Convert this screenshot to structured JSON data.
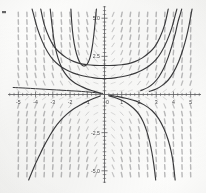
{
  "chart_data": {
    "type": "line",
    "title": "",
    "subtitle": "",
    "xlabel": "",
    "ylabel": "",
    "xlim": [
      -5.6,
      5.6
    ],
    "ylim": [
      -5.8,
      5.8
    ],
    "grid": false,
    "axis_style": "center-cross",
    "background_color": "#fdfdfc",
    "axis_color": "#58585a",
    "curve_color": "#3b3b3d",
    "field_color": "#8c8c8e",
    "x_ticks": [
      -5,
      -4,
      -3,
      -2,
      -1,
      0,
      1,
      2,
      3,
      4,
      5
    ],
    "x_tick_labels": [
      "-5",
      "-4",
      "-3",
      "-2",
      "-1",
      "0",
      "1",
      "2",
      "3",
      "4",
      "5"
    ],
    "x_minor_tick_step": 0.25,
    "y_ticks": [
      -5.0,
      -2.5,
      2.5,
      5.0
    ],
    "y_tick_labels": [
      "-5.0",
      "-2.5",
      "2.5",
      "5.0"
    ],
    "y_minor_tick_step": 0.25,
    "slope_field": {
      "description": "direction field of hand-drawn dash marks, steep near vertical toward left/right extremes, shallow near the horizontal axis",
      "x_start": -5.0,
      "x_end": 5.0,
      "x_step": 0.5,
      "y_start": -5.25,
      "y_end": 5.25,
      "y_step": 0.5,
      "marker_length": 4.5,
      "slope_formula": "dy/dx = y * x",
      "color": "#8e8e90",
      "opacity": 0.62
    },
    "series": [
      {
        "name": "solution-curve-1",
        "kind": "even-symmetric-well",
        "note": "shallow U through (0, 1.05) rising steeply past |x|=3.6",
        "param_c": 1.05,
        "color": "#3b3b3d",
        "width": 1.15,
        "points_x": [
          -4.2,
          -3.9,
          -3.6,
          -3.3,
          -3.0,
          -2.6,
          -2.2,
          -1.8,
          -1.4,
          -1.0,
          -0.6,
          -0.2,
          0.2,
          0.6,
          1.0,
          1.4,
          1.8,
          2.2,
          2.6,
          3.0,
          3.3,
          3.6,
          3.9,
          4.2
        ],
        "points_y": [
          5.6,
          4.35,
          3.45,
          2.78,
          2.3,
          1.88,
          1.6,
          1.4,
          1.26,
          1.16,
          1.09,
          1.05,
          1.05,
          1.09,
          1.16,
          1.26,
          1.4,
          1.6,
          1.88,
          2.3,
          2.78,
          3.45,
          4.35,
          5.6
        ]
      },
      {
        "name": "solution-curve-2",
        "kind": "even-symmetric-well",
        "note": "U through (0, 1.9), steeper walls near |x|=3.2",
        "param_c": 1.9,
        "color": "#3b3b3d",
        "width": 1.15,
        "points_x": [
          -3.7,
          -3.5,
          -3.2,
          -2.9,
          -2.6,
          -2.2,
          -1.8,
          -1.4,
          -1.0,
          -0.6,
          -0.2,
          0.2,
          0.6,
          1.0,
          1.4,
          1.8,
          2.2,
          2.6,
          2.9,
          3.2,
          3.5,
          3.7
        ],
        "points_y": [
          5.6,
          4.6,
          3.7,
          3.1,
          2.75,
          2.4,
          2.17,
          2.02,
          1.95,
          1.91,
          1.9,
          1.9,
          1.91,
          1.95,
          2.02,
          2.17,
          2.4,
          2.75,
          3.1,
          3.7,
          4.6,
          5.6
        ]
      },
      {
        "name": "solution-curve-3",
        "kind": "narrow-well-left",
        "note": "narrow U centred near x=-1.15 with near vertical arms",
        "param_c": 0.0,
        "color": "#3b3b3d",
        "width": 1.15,
        "points_x": [
          -1.95,
          -1.9,
          -1.82,
          -1.7,
          -1.55,
          -1.4,
          -1.25,
          -1.1,
          -0.95,
          -0.82,
          -0.7,
          -0.6,
          -0.52,
          -0.47
        ],
        "points_y": [
          5.6,
          4.7,
          3.8,
          3.0,
          2.4,
          2.05,
          1.88,
          1.9,
          2.1,
          2.5,
          3.2,
          4.1,
          5.0,
          5.6
        ]
      },
      {
        "name": "solution-curve-4",
        "kind": "hyperbolic-branch-left",
        "note": "upper-left branch falling from y=5.6 near x=-3.1 and flattening toward the x-axis",
        "color": "#3b3b3d",
        "width": 1.15,
        "points_x": [
          -3.15,
          -3.05,
          -2.95,
          -2.85,
          -2.7,
          -2.5,
          -2.3,
          -2.0,
          -1.7,
          -1.4,
          -1.1,
          -0.8,
          -0.5,
          -0.2
        ],
        "points_y": [
          5.6,
          4.6,
          3.7,
          3.05,
          2.4,
          1.8,
          1.4,
          1.0,
          0.74,
          0.55,
          0.4,
          0.28,
          0.17,
          0.07
        ]
      },
      {
        "name": "solution-curve-5",
        "kind": "hyperbolic-branch-left-lower",
        "note": "lower-left branch dropping to y=-5.6 near x=-4.35",
        "color": "#3b3b3d",
        "width": 1.15,
        "points_x": [
          -0.25,
          -0.6,
          -1.0,
          -1.4,
          -1.8,
          -2.2,
          -2.55,
          -2.9,
          -3.2,
          -3.5,
          -3.8,
          -4.05,
          -4.25,
          -4.4
        ],
        "points_y": [
          -0.1,
          -0.25,
          -0.45,
          -0.68,
          -0.95,
          -1.3,
          -1.7,
          -2.2,
          -2.75,
          -3.35,
          -4.05,
          -4.65,
          -5.2,
          -5.6
        ]
      },
      {
        "name": "solution-curve-6",
        "kind": "hyperbolic-branch-right",
        "note": "right-side branch from near the origin diving to -5.6 around x=2.95",
        "color": "#3b3b3d",
        "width": 1.15,
        "points_x": [
          0.25,
          0.6,
          1.0,
          1.35,
          1.7,
          2.0,
          2.25,
          2.45,
          2.62,
          2.75,
          2.85,
          2.92,
          2.97
        ],
        "points_y": [
          -0.08,
          -0.2,
          -0.38,
          -0.6,
          -0.92,
          -1.3,
          -1.8,
          -2.4,
          -3.1,
          -3.8,
          -4.5,
          -5.1,
          -5.6
        ]
      },
      {
        "name": "solution-curve-7",
        "kind": "hyperbolic-branch-right-2",
        "note": "second right branch diving to -5.6 around x=4.1",
        "color": "#3b3b3d",
        "width": 1.15,
        "points_x": [
          0.3,
          0.8,
          1.3,
          1.8,
          2.3,
          2.75,
          3.15,
          3.45,
          3.7,
          3.88,
          4.0,
          4.1
        ],
        "points_y": [
          -0.05,
          -0.14,
          -0.26,
          -0.42,
          -0.68,
          -1.05,
          -1.6,
          -2.25,
          -3.0,
          -3.8,
          -4.6,
          -5.6
        ]
      },
      {
        "name": "solution-curve-8",
        "kind": "rising-right-arm",
        "note": "steep rising arm on the right reaching y=5.6 near x=4.45",
        "color": "#3b3b3d",
        "width": 1.15,
        "points_x": [
          2.1,
          2.5,
          2.85,
          3.15,
          3.45,
          3.7,
          3.9,
          4.1,
          4.25,
          4.38,
          4.48
        ],
        "points_y": [
          0.25,
          0.45,
          0.75,
          1.15,
          1.75,
          2.45,
          3.15,
          3.95,
          4.7,
          5.2,
          5.6
        ]
      },
      {
        "name": "solution-curve-9",
        "kind": "rising-right-arm-outer",
        "note": "outermost rising arm on the right reaching y=5.6 near x=5.05",
        "color": "#3b3b3d",
        "width": 1.15,
        "points_x": [
          2.6,
          3.0,
          3.35,
          3.7,
          4.0,
          4.3,
          4.55,
          4.75,
          4.9,
          5.0,
          5.08
        ],
        "points_y": [
          0.2,
          0.36,
          0.6,
          0.95,
          1.45,
          2.15,
          2.95,
          3.75,
          4.5,
          5.1,
          5.6
        ]
      },
      {
        "name": "solution-curve-10",
        "kind": "near-axis-left",
        "note": "flat near-axis curve just above the x-axis on the left",
        "color": "#3b3b3d",
        "width": 1.0,
        "points_x": [
          -5.3,
          -4.6,
          -4.0,
          -3.4,
          -2.8,
          -2.2,
          -1.6,
          -1.1,
          -0.7,
          -0.35,
          -0.1
        ],
        "points_y": [
          0.46,
          0.42,
          0.38,
          0.34,
          0.3,
          0.26,
          0.22,
          0.18,
          0.14,
          0.1,
          0.07
        ]
      }
    ]
  },
  "figure": {
    "corner_mark": "",
    "caption": ""
  }
}
